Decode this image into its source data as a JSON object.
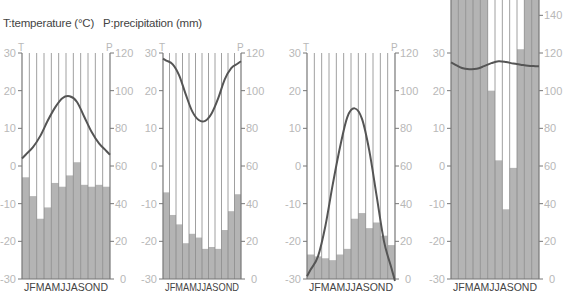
{
  "legend": {
    "text": "T:temperature (°C)   P:precipitation (mm)",
    "temperature_label": "T:temperature (°C)",
    "precipitation_label": "P:precipitation (mm)"
  },
  "colors": {
    "bar": "#b4b4b4",
    "bar_outline": "#777777",
    "line": "#555555",
    "axis": "#777777",
    "tick_text": "#b8b8b8",
    "grid": "#888888"
  },
  "chart_data": [
    {
      "type": "bar+line",
      "title": "Climate chart 1",
      "categories": [
        "J",
        "F",
        "M",
        "A",
        "M",
        "J",
        "J",
        "A",
        "S",
        "O",
        "N",
        "D"
      ],
      "category_label": "JFMAMJJASOND",
      "left_axis": {
        "label": "T",
        "ticks": [
          30,
          20,
          10,
          0,
          -10,
          -20,
          -30
        ],
        "ylim": [
          -30,
          30
        ]
      },
      "right_axis": {
        "label": "P",
        "ticks": [
          120,
          100,
          80,
          60,
          40,
          20,
          0
        ],
        "ylim": [
          0,
          120
        ]
      },
      "series": [
        {
          "name": "precipitation (mm)",
          "type": "bar",
          "values": [
            54,
            44,
            32,
            38,
            51,
            49,
            55,
            62,
            50,
            49,
            50,
            49
          ]
        },
        {
          "name": "temperature (°C)",
          "type": "line",
          "values": [
            3,
            5,
            8,
            12,
            15.5,
            18,
            18.5,
            17,
            13,
            9,
            6,
            4
          ]
        }
      ]
    },
    {
      "type": "bar+line",
      "title": "Climate chart 2",
      "categories": [
        "J",
        "F",
        "M",
        "A",
        "M",
        "J",
        "J",
        "A",
        "S",
        "O",
        "N",
        "D"
      ],
      "category_label": "JFMAMJJASOND",
      "left_axis": {
        "label": "T",
        "ticks": [
          30,
          20,
          10,
          0,
          -10,
          -20,
          -30
        ],
        "ylim": [
          -30,
          30
        ]
      },
      "right_axis": {
        "label": "P",
        "ticks": [
          120,
          100,
          80,
          60,
          40,
          20,
          0
        ],
        "ylim": [
          0,
          120
        ]
      },
      "series": [
        {
          "name": "precipitation (mm)",
          "type": "bar",
          "values": [
            46,
            34,
            29,
            19,
            24,
            22,
            16,
            17,
            16,
            26,
            36,
            45
          ]
        },
        {
          "name": "temperature (°C)",
          "type": "line",
          "values": [
            28,
            27,
            24,
            19,
            14.5,
            12.2,
            12,
            14,
            18,
            23,
            26,
            27.2
          ]
        }
      ]
    },
    {
      "type": "bar+line",
      "title": "Climate chart 3",
      "categories": [
        "J",
        "F",
        "M",
        "A",
        "M",
        "J",
        "J",
        "A",
        "S",
        "O",
        "N",
        "D"
      ],
      "category_label": "JFMAMJJASOND",
      "left_axis": {
        "label": "T",
        "ticks": [
          30,
          20,
          10,
          0,
          -10,
          -20,
          -30
        ],
        "ylim": [
          -30,
          30
        ]
      },
      "right_axis": {
        "label": "P",
        "ticks": [
          120,
          100,
          80,
          60,
          40,
          20,
          0
        ],
        "ylim": [
          0,
          120
        ]
      },
      "series": [
        {
          "name": "precipitation (mm)",
          "type": "bar",
          "values": [
            13,
            12,
            11,
            10,
            13,
            16,
            32,
            35,
            27,
            30,
            23,
            18
          ]
        },
        {
          "name": "temperature (°C)",
          "type": "line",
          "values": [
            -27.5,
            -24,
            -16,
            -5,
            5,
            13,
            15.3,
            12.5,
            4,
            -8,
            -20,
            -27
          ]
        }
      ]
    },
    {
      "type": "bar+line",
      "title": "Climate chart 4",
      "categories": [
        "J",
        "F",
        "M",
        "A",
        "M",
        "J",
        "J",
        "A",
        "S",
        "O",
        "N",
        "D"
      ],
      "category_label": "JFMAMJJASOND",
      "left_axis": {
        "label": "T",
        "ticks": [
          30,
          20,
          10,
          0,
          -10,
          -20,
          -30
        ],
        "ylim": [
          -30,
          30
        ]
      },
      "right_axis": {
        "label": "P",
        "ticks": [
          140,
          120,
          100,
          80,
          60,
          40,
          20,
          0
        ],
        "ylim": [
          0,
          120
        ]
      },
      "series": [
        {
          "name": "precipitation (mm)",
          "type": "bar",
          "values": [
            170,
            170,
            170,
            170,
            170,
            100,
            63,
            37,
            59,
            122,
            170,
            170
          ]
        },
        {
          "name": "temperature (°C)",
          "type": "line",
          "values": [
            27,
            26,
            25.7,
            25.8,
            26.5,
            27.3,
            27.8,
            27.6,
            27.2,
            26.9,
            26.6,
            26.5
          ]
        }
      ]
    }
  ],
  "layout": {
    "charts": [
      {
        "x0": 22,
        "x1": 110
      },
      {
        "x0": 163,
        "x1": 241
      },
      {
        "x0": 307,
        "x1": 395
      },
      {
        "x0": 451,
        "x1": 539
      }
    ],
    "y_top": 53,
    "y_zero": 166,
    "y_bottom": 279
  }
}
